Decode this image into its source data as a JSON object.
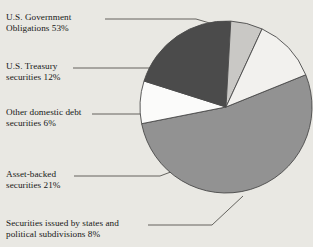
{
  "chart_data": {
    "type": "pie",
    "title": "",
    "categories": [
      "U.S. Government Obligations",
      "Securities issued by states and political subdivisions",
      "Asset-backed securities",
      "Other domestic debt securities",
      "U.S. Treasury securities"
    ],
    "values": [
      53,
      8,
      21,
      6,
      12
    ],
    "value_unit": "%",
    "colors": [
      "#929292",
      "#fbfbfa",
      "#4b4b4b",
      "#c9c8c5",
      "#f2f1ee"
    ],
    "legend": "callout-labels",
    "grid": false
  },
  "labels": {
    "government": {
      "line1": "U.S. Government",
      "line2": "Obligations 53%"
    },
    "treasury": {
      "line1": "U.S. Treasury",
      "line2": "securities 12%"
    },
    "other_domestic": {
      "line1": "Other domestic debt",
      "line2": "securities 6%"
    },
    "asset_backed": {
      "line1": "Asset-backed",
      "line2": "securities 21%"
    },
    "states": {
      "line1": "Securities issued by states and",
      "line2": "political subdivisions 8%"
    }
  },
  "style": {
    "background": "#e9e8e3",
    "outline": "#4a4a4a",
    "text": "#181818"
  }
}
